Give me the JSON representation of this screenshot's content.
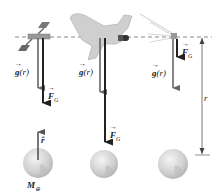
{
  "diagram": {
    "reference_line": "dashed orbital altitude line",
    "objects": [
      {
        "name": "satellite",
        "g_label": "g",
        "g_arg": "(r)",
        "f_label": "F",
        "f_sub": "G"
      },
      {
        "name": "space-shuttle",
        "g_label": "g",
        "g_arg": "(r)",
        "f_label": "F",
        "f_sub": "G"
      },
      {
        "name": "small-object",
        "g_label": "g",
        "g_arg": "(r)",
        "f_label": "F",
        "f_sub": "G"
      }
    ],
    "earth": {
      "mass_label": "M",
      "mass_sub": "⊕",
      "unit_vector_label": "r̂"
    },
    "distance_label": "r"
  },
  "colors": {
    "arrow": "#555555",
    "arrow_dark": "#222222",
    "dashed": "#888888",
    "earth": "#d8d8d8"
  }
}
